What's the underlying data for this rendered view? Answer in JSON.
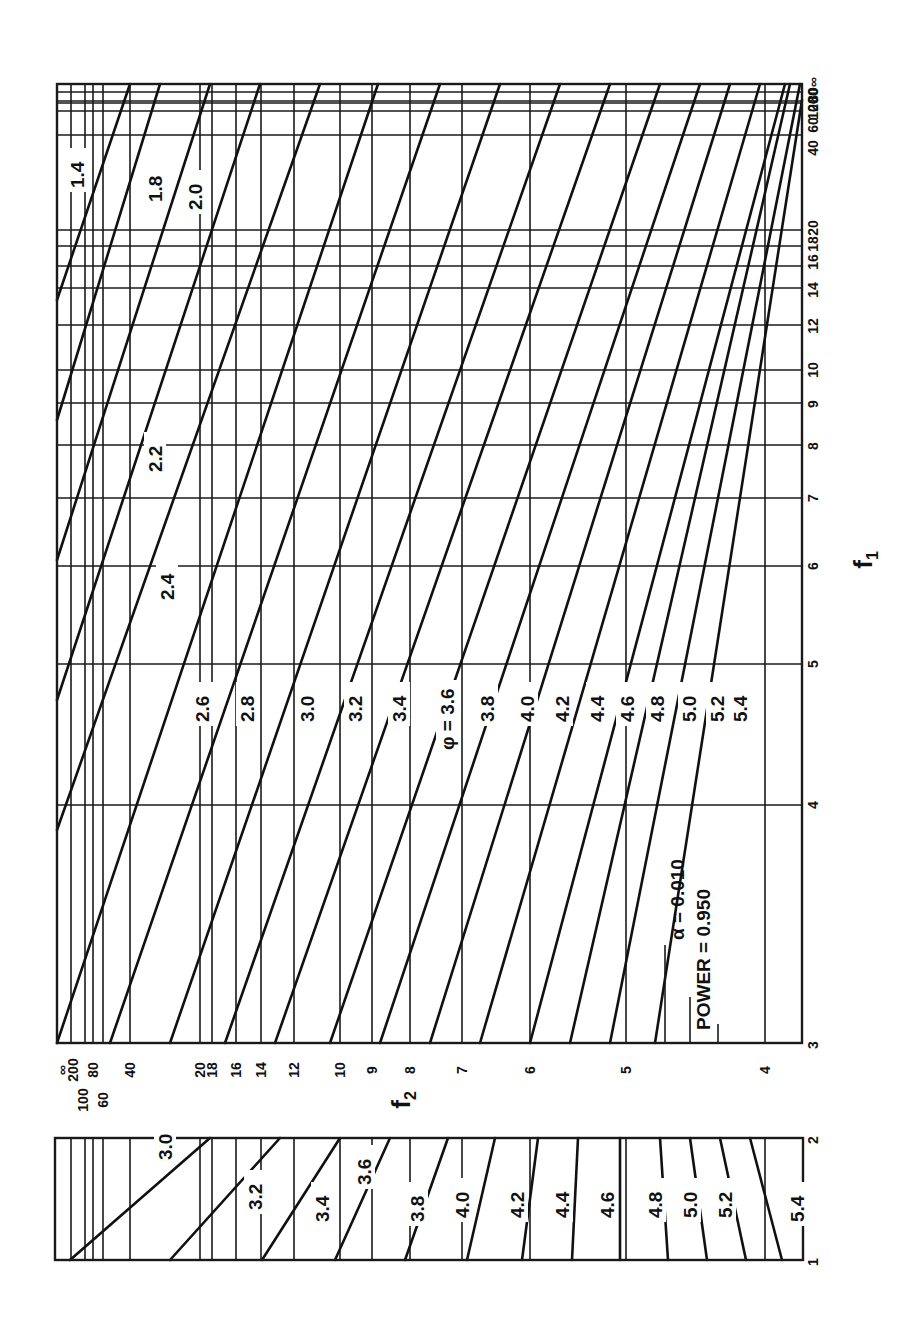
{
  "chart_data": {
    "type": "line",
    "orientation": "rotated 90° counter-clockwise (f1 axis runs vertically along right edge, f2 axis runs horizontally)",
    "legend": {
      "alpha_label": "α = 0.010",
      "power_label": "POWER = 0.950"
    },
    "axis_f1": {
      "label": "f1",
      "main_panel_ticks": [
        "3",
        "4",
        "5",
        "6",
        "7",
        "8",
        "9",
        "10",
        "12",
        "14",
        "16",
        "18",
        "20",
        "40",
        "60",
        "80",
        "100",
        "200",
        "∞"
      ],
      "lower_panel_ticks": [
        "1",
        "2"
      ]
    },
    "axis_f2": {
      "label": "f2",
      "ticks": [
        "∞",
        "200",
        "100",
        "80",
        "60",
        "40",
        "20",
        "18",
        "16",
        "14",
        "12",
        "10",
        "9",
        "8",
        "7",
        "6",
        "5",
        "4"
      ]
    },
    "series_label_prefix": "φ",
    "main_panel_series": [
      "1.4",
      "1.8",
      "2.0",
      "2.2",
      "2.4",
      "2.6",
      "2.8",
      "3.0",
      "3.2",
      "3.4",
      "3.6",
      "3.8",
      "4.0",
      "4.2",
      "4.4",
      "4.6",
      "4.8",
      "5.0",
      "5.2",
      "5.4"
    ],
    "lower_panel_series": [
      "3.0",
      "3.2",
      "3.4",
      "3.6",
      "3.8",
      "4.0",
      "4.2",
      "4.4",
      "4.6",
      "4.8",
      "5.0",
      "5.2",
      "5.4"
    ],
    "grid": true
  },
  "layout": {
    "main": {
      "x0": 57,
      "y0": 84,
      "x1": 802,
      "y1": 1043
    },
    "lower": {
      "x0": 55,
      "y0": 1138,
      "x1": 803,
      "y1": 1260
    },
    "f2_lines_x": [
      71,
      85,
      93,
      103,
      130,
      200,
      212,
      236,
      261,
      294,
      340,
      372,
      410,
      462,
      530,
      626,
      765
    ],
    "f1_lines_y": [
      92,
      101,
      103,
      111,
      135,
      230,
      246,
      266,
      288,
      325,
      370,
      403,
      445,
      498,
      566,
      664,
      805
    ],
    "f1_tick_labels": [
      {
        "t": "∞",
        "y": 82
      },
      {
        "t": "200",
        "y": 100
      },
      {
        "t": "100",
        "y": 108
      },
      {
        "t": "80",
        "y": 95
      },
      {
        "t": "60",
        "y": 125
      },
      {
        "t": "40",
        "y": 148
      },
      {
        "t": "20",
        "y": 228
      },
      {
        "t": "18",
        "y": 244
      },
      {
        "t": "16",
        "y": 262
      },
      {
        "t": "14",
        "y": 290
      },
      {
        "t": "12",
        "y": 326
      },
      {
        "t": "10",
        "y": 370
      },
      {
        "t": "9",
        "y": 404
      },
      {
        "t": "8",
        "y": 446
      },
      {
        "t": "7",
        "y": 498
      },
      {
        "t": "6",
        "y": 566
      },
      {
        "t": "5",
        "y": 664
      },
      {
        "t": "4",
        "y": 805
      },
      {
        "t": "3",
        "y": 1045
      },
      {
        "t": "2",
        "y": 1140
      },
      {
        "t": "1",
        "y": 1262
      }
    ],
    "f2_tick_labels": [
      {
        "t": "∞",
        "x": 62
      },
      {
        "t": "200",
        "x": 73
      },
      {
        "t": "100",
        "x": 83
      },
      {
        "t": "80",
        "x": 93
      },
      {
        "t": "60",
        "x": 103
      },
      {
        "t": "40",
        "x": 130
      },
      {
        "t": "20",
        "x": 200
      },
      {
        "t": "18",
        "x": 212
      },
      {
        "t": "16",
        "x": 236
      },
      {
        "t": "14",
        "x": 261
      },
      {
        "t": "12",
        "x": 294
      },
      {
        "t": "10",
        "x": 340
      },
      {
        "t": "9",
        "x": 372
      },
      {
        "t": "8",
        "x": 410
      },
      {
        "t": "7",
        "x": 462
      },
      {
        "t": "6",
        "x": 530
      },
      {
        "t": "5",
        "x": 626
      },
      {
        "t": "4",
        "x": 765
      }
    ],
    "main_curves": [
      [
        57,
        300,
        130,
        84
      ],
      [
        57,
        420,
        160,
        84
      ],
      [
        57,
        560,
        210,
        84
      ],
      [
        57,
        700,
        260,
        84
      ],
      [
        57,
        830,
        320,
        84
      ],
      [
        57,
        1043,
        378,
        84
      ],
      [
        110,
        1043,
        440,
        84
      ],
      [
        170,
        1043,
        500,
        84
      ],
      [
        225,
        1043,
        560,
        84
      ],
      [
        275,
        1043,
        610,
        84
      ],
      [
        330,
        1043,
        660,
        84
      ],
      [
        380,
        1043,
        700,
        84
      ],
      [
        430,
        1043,
        730,
        84
      ],
      [
        480,
        1043,
        760,
        84
      ],
      [
        530,
        1043,
        785,
        84
      ],
      [
        570,
        1043,
        790,
        84
      ],
      [
        610,
        1043,
        800,
        84
      ],
      [
        655,
        1043,
        802,
        100
      ]
    ],
    "main_curve_labels": [
      {
        "t": "1.4",
        "x": 70,
        "y": 188
      },
      {
        "t": "1.8",
        "x": 148,
        "y": 202
      },
      {
        "t": "2.0",
        "x": 188,
        "y": 210
      },
      {
        "t": "2.2",
        "x": 148,
        "y": 472
      },
      {
        "t": "2.4",
        "x": 160,
        "y": 600
      },
      {
        "t": "2.6",
        "x": 195,
        "y": 722
      },
      {
        "t": "2.8",
        "x": 240,
        "y": 722
      },
      {
        "t": "3.0",
        "x": 300,
        "y": 722
      },
      {
        "t": "3.2",
        "x": 348,
        "y": 722
      },
      {
        "t": "3.4",
        "x": 392,
        "y": 722
      },
      {
        "t": "φ = 3.6",
        "x": 440,
        "y": 750
      },
      {
        "t": "3.8",
        "x": 480,
        "y": 722
      },
      {
        "t": "4.0",
        "x": 520,
        "y": 722
      },
      {
        "t": "4.2",
        "x": 555,
        "y": 722
      },
      {
        "t": "4.4",
        "x": 590,
        "y": 722
      },
      {
        "t": "4.6",
        "x": 620,
        "y": 722
      },
      {
        "t": "4.8",
        "x": 650,
        "y": 722
      },
      {
        "t": "5.0",
        "x": 682,
        "y": 722
      },
      {
        "t": "5.2",
        "x": 710,
        "y": 722
      },
      {
        "t": "5.4",
        "x": 733,
        "y": 722
      }
    ],
    "lower_curves": [
      [
        70,
        1260,
        210,
        1138
      ],
      [
        170,
        1260,
        280,
        1138
      ],
      [
        262,
        1260,
        340,
        1138
      ],
      [
        335,
        1260,
        390,
        1138
      ],
      [
        405,
        1260,
        448,
        1138
      ],
      [
        467,
        1260,
        495,
        1138
      ],
      [
        522,
        1260,
        538,
        1138
      ],
      [
        572,
        1260,
        578,
        1138
      ],
      [
        620,
        1260,
        620,
        1138
      ],
      [
        668,
        1260,
        660,
        1138
      ],
      [
        707,
        1260,
        690,
        1138
      ],
      [
        746,
        1260,
        720,
        1138
      ],
      [
        782,
        1260,
        750,
        1138
      ]
    ],
    "lower_curve_labels": [
      {
        "t": "3.0",
        "x": 158,
        "y": 1160
      },
      {
        "t": "3.2",
        "x": 248,
        "y": 1210
      },
      {
        "t": "3.4",
        "x": 315,
        "y": 1222
      },
      {
        "t": "3.6",
        "x": 357,
        "y": 1185
      },
      {
        "t": "3.8",
        "x": 410,
        "y": 1222
      },
      {
        "t": "4.0",
        "x": 455,
        "y": 1218
      },
      {
        "t": "4.2",
        "x": 510,
        "y": 1218
      },
      {
        "t": "4.4",
        "x": 555,
        "y": 1218
      },
      {
        "t": "4.6",
        "x": 600,
        "y": 1218
      },
      {
        "t": "4.8",
        "x": 648,
        "y": 1218
      },
      {
        "t": "5.0",
        "x": 683,
        "y": 1218
      },
      {
        "t": "5.2",
        "x": 718,
        "y": 1218
      },
      {
        "t": "5.4",
        "x": 790,
        "y": 1222
      }
    ]
  }
}
